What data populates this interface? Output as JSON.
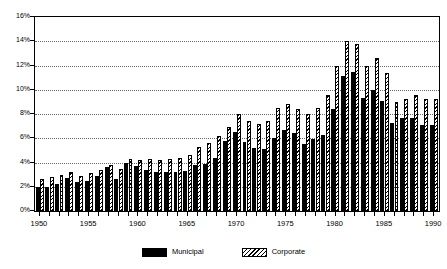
{
  "chart_data": {
    "type": "bar",
    "title": "",
    "subtitle": "",
    "xlabel": "",
    "ylabel": "",
    "xlim": [
      1950,
      1990
    ],
    "ylim": [
      0,
      16
    ],
    "y_tick_labels": [
      "0%",
      "2%",
      "4%",
      "6%",
      "8%",
      "10%",
      "12%",
      "14%",
      "16%"
    ],
    "y_tick_values": [
      0,
      2,
      4,
      6,
      8,
      10,
      12,
      14,
      16
    ],
    "x_tick_labels": [
      "1950",
      "1955",
      "1960",
      "1965",
      "1970",
      "1975",
      "1980",
      "1985",
      "1990"
    ],
    "x_tick_values": [
      1950,
      1955,
      1960,
      1965,
      1970,
      1975,
      1980,
      1985,
      1990
    ],
    "grid": "horizontal-dotted",
    "legend_position": "bottom-center",
    "categories": [
      1950,
      1951,
      1952,
      1953,
      1954,
      1955,
      1956,
      1957,
      1958,
      1959,
      1960,
      1961,
      1962,
      1963,
      1964,
      1965,
      1966,
      1967,
      1968,
      1969,
      1970,
      1971,
      1972,
      1973,
      1974,
      1975,
      1976,
      1977,
      1978,
      1979,
      1980,
      1981,
      1982,
      1983,
      1984,
      1985,
      1986,
      1987,
      1988,
      1989,
      1990
    ],
    "series": [
      {
        "name": "Municipal",
        "style": "solid-black",
        "color": "#000000",
        "values": [
          2.0,
          2.0,
          2.2,
          2.7,
          2.4,
          2.5,
          2.9,
          3.6,
          2.6,
          4.0,
          3.7,
          3.4,
          3.2,
          3.2,
          3.2,
          3.3,
          3.8,
          3.9,
          4.4,
          5.8,
          6.5,
          5.7,
          5.2,
          5.1,
          6.0,
          6.7,
          6.4,
          5.5,
          5.9,
          6.3,
          8.4,
          11.1,
          11.5,
          9.3,
          10.0,
          9.1,
          7.3,
          7.7,
          7.7,
          7.1,
          7.1
        ]
      },
      {
        "name": "Corporate",
        "style": "diagonal-hatch",
        "color": "#ffffff",
        "values": [
          2.6,
          2.8,
          3.0,
          3.2,
          2.9,
          3.1,
          3.4,
          3.8,
          3.5,
          4.3,
          4.2,
          4.3,
          4.2,
          4.3,
          4.4,
          4.6,
          5.3,
          5.6,
          6.2,
          6.9,
          8.0,
          7.4,
          7.2,
          7.4,
          8.5,
          8.8,
          8.4,
          8.0,
          8.5,
          9.6,
          12.0,
          14.0,
          13.8,
          12.0,
          12.6,
          11.4,
          9.0,
          9.2,
          9.6,
          9.2,
          9.2
        ]
      }
    ]
  },
  "legend": {
    "items": [
      {
        "label": "Municipal",
        "swatch": "solid-black-swatch"
      },
      {
        "label": "Corporate",
        "swatch": "diagonal-hatch-swatch"
      }
    ]
  }
}
